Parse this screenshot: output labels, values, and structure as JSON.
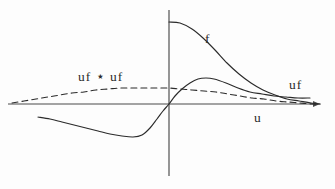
{
  "figure": {
    "title": ""
  },
  "labels": {
    "convolution": "uf ⋆ uf",
    "f": "f",
    "uf": "uf",
    "axis_u": "u"
  },
  "icons": {
    "axis_arrow": "right-arrow-icon"
  },
  "colors": {
    "ink": "#2b2b2b",
    "axis": "#4a4a4a",
    "background": "#fdfdfd"
  },
  "chart_data": {
    "type": "line",
    "title": "",
    "xlabel": "u",
    "ylabel": "",
    "grid": false,
    "legend": "inline-annotations",
    "axes": {
      "x_axis_y_px": 104,
      "y_axis_x_px": 169,
      "x_axis_extent_px": [
        8,
        320
      ],
      "y_axis_extent_px": [
        10,
        176
      ],
      "arrow_at_x_end": true
    },
    "series": [
      {
        "name": "f",
        "label": "f",
        "style": "solid",
        "note": "decaying positive curve starting high on the y-axis, monotonically falling to the right, crossing uf near the right edge",
        "points_px": [
          [
            169,
            22
          ],
          [
            180,
            23
          ],
          [
            192,
            29
          ],
          [
            203,
            38
          ],
          [
            215,
            50
          ],
          [
            227,
            63
          ],
          [
            239,
            74
          ],
          [
            251,
            83
          ],
          [
            263,
            90
          ],
          [
            275,
            95
          ],
          [
            287,
            99
          ],
          [
            299,
            101
          ],
          [
            311,
            103
          ],
          [
            320,
            104
          ]
        ]
      },
      {
        "name": "uf",
        "label": "uf",
        "style": "solid",
        "note": "odd-like curve: negative lobe on the left with a minimum, steep rise through the origin, positive peak just right of origin, then slow decay toward the axis",
        "points_px": [
          [
            38,
            117
          ],
          [
            50,
            119
          ],
          [
            62,
            122
          ],
          [
            74,
            125
          ],
          [
            86,
            128
          ],
          [
            98,
            131
          ],
          [
            110,
            134
          ],
          [
            122,
            136
          ],
          [
            133,
            137
          ],
          [
            142,
            135
          ],
          [
            150,
            128
          ],
          [
            157,
            119
          ],
          [
            163,
            111
          ],
          [
            169,
            104
          ],
          [
            175,
            96
          ],
          [
            182,
            89
          ],
          [
            190,
            83
          ],
          [
            198,
            79
          ],
          [
            206,
            78
          ],
          [
            214,
            79
          ],
          [
            226,
            83
          ],
          [
            238,
            88
          ],
          [
            250,
            92
          ],
          [
            262,
            94
          ],
          [
            274,
            96
          ],
          [
            286,
            97
          ],
          [
            298,
            98
          ],
          [
            310,
            98
          ]
        ]
      },
      {
        "name": "uf_conv_uf",
        "label": "uf ⋆ uf",
        "style": "dashed",
        "note": "broad low hump, dashed; peaks slightly left of the y-axis near the origin and decays slowly on both sides",
        "points_px": [
          [
            12,
            103
          ],
          [
            24,
            101
          ],
          [
            36,
            99
          ],
          [
            48,
            97
          ],
          [
            60,
            95
          ],
          [
            72,
            93
          ],
          [
            84,
            92
          ],
          [
            96,
            90
          ],
          [
            108,
            89
          ],
          [
            120,
            88
          ],
          [
            132,
            88
          ],
          [
            144,
            88
          ],
          [
            156,
            88
          ],
          [
            168,
            88
          ],
          [
            180,
            89
          ],
          [
            192,
            90
          ],
          [
            204,
            91
          ],
          [
            216,
            92
          ],
          [
            228,
            94
          ],
          [
            240,
            96
          ],
          [
            252,
            98
          ],
          [
            264,
            99
          ],
          [
            276,
            101
          ],
          [
            288,
            102
          ],
          [
            300,
            103
          ],
          [
            312,
            104
          ],
          [
            320,
            104
          ]
        ]
      }
    ],
    "annotations": [
      {
        "text": "uf ⋆ uf",
        "x_px": 78,
        "y_px": 70,
        "attached_to": "uf_conv_uf"
      },
      {
        "text": "f",
        "x_px": 205,
        "y_px": 32,
        "attached_to": "f"
      },
      {
        "text": "uf",
        "x_px": 289,
        "y_px": 78,
        "attached_to": "uf"
      },
      {
        "text": "u",
        "x_px": 254,
        "y_px": 111,
        "attached_to": "x-axis"
      }
    ]
  }
}
